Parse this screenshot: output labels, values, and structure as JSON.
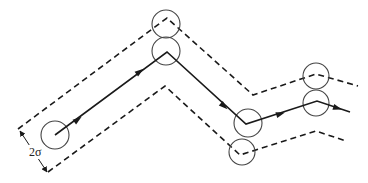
{
  "diagram": {
    "label": "2σ",
    "stroke_color": "#1a1a1a",
    "circle_color": "#444444",
    "path_points": [
      [
        55,
        135
      ],
      [
        167,
        52
      ],
      [
        246,
        124
      ],
      [
        317,
        101
      ],
      [
        350,
        112
      ]
    ],
    "upper_boundary": [
      [
        18,
        129
      ],
      [
        167,
        18
      ],
      [
        253,
        95
      ],
      [
        316,
        74
      ],
      [
        358,
        86
      ]
    ],
    "lower_boundary": [
      [
        48,
        172
      ],
      [
        165,
        86
      ],
      [
        240,
        155
      ],
      [
        316,
        131
      ],
      [
        346,
        141
      ]
    ],
    "circles": [
      {
        "cx": 55,
        "cy": 135,
        "r": 14
      },
      {
        "cx": 166,
        "cy": 24,
        "r": 14
      },
      {
        "cx": 166,
        "cy": 51,
        "r": 14
      },
      {
        "cx": 248,
        "cy": 123,
        "r": 14
      },
      {
        "cx": 242,
        "cy": 152,
        "r": 13
      },
      {
        "cx": 316,
        "cy": 76,
        "r": 13
      },
      {
        "cx": 316,
        "cy": 103,
        "r": 13
      }
    ],
    "arrows": [
      {
        "x": 80,
        "y": 118,
        "angle": -36
      },
      {
        "x": 142,
        "y": 70,
        "angle": -36
      },
      {
        "x": 226,
        "y": 108,
        "angle": 42
      },
      {
        "x": 283,
        "y": 113,
        "angle": -18
      },
      {
        "x": 340,
        "y": 109,
        "angle": 18
      }
    ],
    "dimension": {
      "x1": 20,
      "y1": 131,
      "x2": 47,
      "y2": 172,
      "label_x": 29,
      "label_y": 156
    }
  }
}
